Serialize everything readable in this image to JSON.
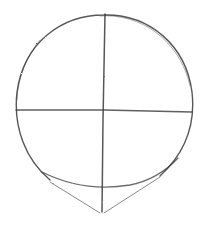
{
  "image": {
    "subject": "head construction sketch",
    "medium": "pencil",
    "background": "#ffffff",
    "stroke_color": "#3a3a3a",
    "elements": [
      "cranium-circle",
      "vertical-center-line",
      "horizontal-center-line",
      "jaw-arc",
      "chin-lines"
    ]
  }
}
